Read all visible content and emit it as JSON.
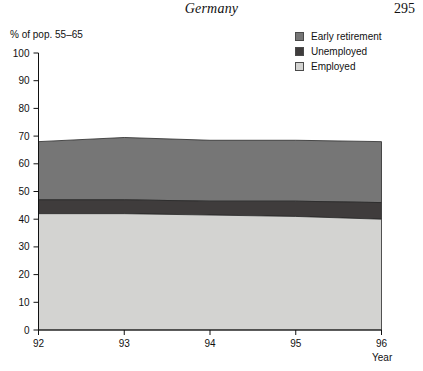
{
  "page": {
    "title": "Germany",
    "number": "295"
  },
  "y_caption": "% of pop. 55–65",
  "x_caption": "Year",
  "legend": {
    "items": [
      {
        "label": "Early retirement",
        "color": "#767676",
        "swatch_name": "legend-swatch-early-retirement"
      },
      {
        "label": "Unemployed",
        "color": "#3f3c3c",
        "swatch_name": "legend-swatch-unemployed"
      },
      {
        "label": "Employed",
        "color": "#d3d3d1",
        "swatch_name": "legend-swatch-employed"
      }
    ]
  },
  "axes": {
    "y_ticks": [
      "100",
      "90",
      "80",
      "70",
      "60",
      "50",
      "40",
      "30",
      "20",
      "10",
      "0"
    ],
    "x_ticks": [
      "92",
      "93",
      "94",
      "95",
      "96"
    ]
  },
  "chart_data": {
    "type": "area",
    "title": "Germany",
    "subtitle": "",
    "xlabel": "Year",
    "ylabel": "% of pop. 55–65",
    "x": [
      92,
      93,
      94,
      95,
      96
    ],
    "xlim": [
      92,
      96
    ],
    "ylim": [
      0,
      100
    ],
    "ytick_step": 10,
    "grid": false,
    "stacked": true,
    "legend_position": "top-right",
    "series": [
      {
        "name": "Employed",
        "color": "#d3d3d1",
        "values": [
          42,
          42,
          41.5,
          41,
          40
        ]
      },
      {
        "name": "Unemployed",
        "color": "#3f3c3c",
        "values": [
          5,
          5,
          5,
          5.5,
          6
        ]
      },
      {
        "name": "Early retirement",
        "color": "#767676",
        "values": [
          21,
          22.5,
          22,
          22,
          22
        ]
      }
    ],
    "cumulative_tops": {
      "Employed": [
        42,
        42,
        41.5,
        41,
        40
      ],
      "Unemployed": [
        47,
        47,
        46.5,
        46.5,
        46
      ],
      "Early retirement": [
        68,
        69.5,
        68.5,
        68.5,
        68
      ]
    }
  }
}
